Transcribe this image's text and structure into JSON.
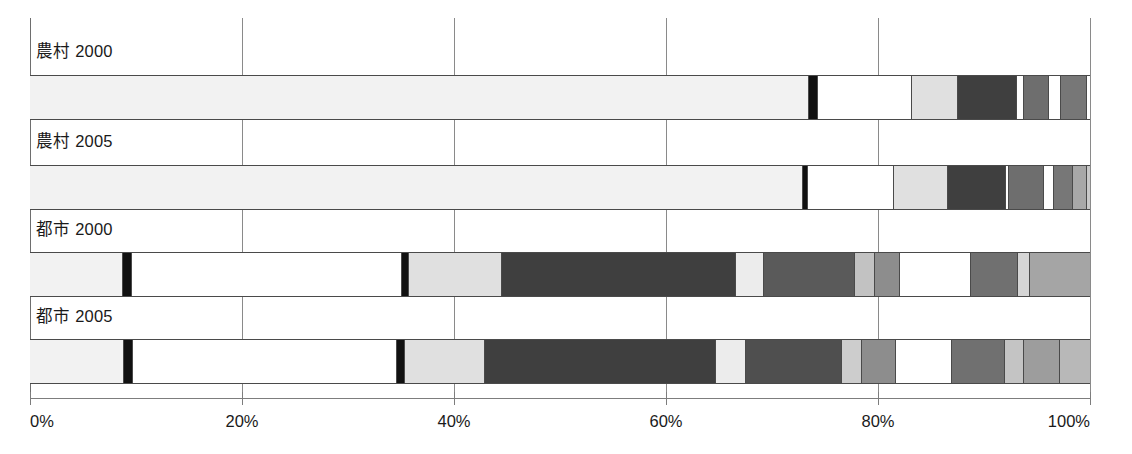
{
  "chart_data": {
    "type": "bar",
    "orientation": "horizontal",
    "stacked": true,
    "normalized": true,
    "title": "",
    "xlabel": "",
    "ylabel": "",
    "xlim": [
      0,
      100
    ],
    "xticks": [
      0,
      20,
      40,
      60,
      80,
      100
    ],
    "xtick_labels": [
      "0%",
      "20%",
      "40%",
      "60%",
      "80%",
      "100%"
    ],
    "grid": true,
    "legend": "none",
    "categories": [
      "農村 2000",
      "農村 2005",
      "都市 2000",
      "都市 2005"
    ],
    "series": [
      {
        "name": "農村 2000",
        "segments": [
          {
            "value": 73.4,
            "color": "#f2f2f2"
          },
          {
            "value": 0.8,
            "color": "#111111"
          },
          {
            "value": 8.9,
            "color": "#ffffff"
          },
          {
            "value": 4.4,
            "color": "#e0e0e0"
          },
          {
            "value": 5.5,
            "color": "#3f3f3f"
          },
          {
            "value": 0.7,
            "color": "#ffffff"
          },
          {
            "value": 2.3,
            "color": "#6e6e6e"
          },
          {
            "value": 1.2,
            "color": "#ffffff"
          },
          {
            "value": 2.4,
            "color": "#777777"
          },
          {
            "value": 0.4,
            "color": "#ffffff"
          },
          {
            "value": 0.0,
            "color": "#9a9a9a"
          }
        ]
      },
      {
        "name": "農村 2005",
        "segments": [
          {
            "value": 72.8,
            "color": "#f2f2f2"
          },
          {
            "value": 0.5,
            "color": "#111111"
          },
          {
            "value": 8.1,
            "color": "#ffffff"
          },
          {
            "value": 5.1,
            "color": "#e0e0e0"
          },
          {
            "value": 5.5,
            "color": "#3f3f3f"
          },
          {
            "value": 0.3,
            "color": "#ffffff"
          },
          {
            "value": 3.3,
            "color": "#6e6e6e"
          },
          {
            "value": 0.9,
            "color": "#ffffff"
          },
          {
            "value": 1.8,
            "color": "#777777"
          },
          {
            "value": 1.3,
            "color": "#a8a8a8"
          },
          {
            "value": 0.4,
            "color": "#c9c9c9"
          }
        ]
      },
      {
        "name": "都市 2000",
        "segments": [
          {
            "value": 8.7,
            "color": "#f2f2f2"
          },
          {
            "value": 0.8,
            "color": "#111111"
          },
          {
            "value": 25.5,
            "color": "#ffffff"
          },
          {
            "value": 0.7,
            "color": "#111111"
          },
          {
            "value": 8.7,
            "color": "#e0e0e0"
          },
          {
            "value": 22.1,
            "color": "#3f3f3f"
          },
          {
            "value": 2.7,
            "color": "#ececec"
          },
          {
            "value": 8.5,
            "color": "#5a5a5a"
          },
          {
            "value": 1.9,
            "color": "#c2c2c2"
          },
          {
            "value": 2.4,
            "color": "#8d8d8d"
          },
          {
            "value": 6.7,
            "color": "#ffffff"
          },
          {
            "value": 4.4,
            "color": "#707070"
          },
          {
            "value": 1.2,
            "color": "#d5d5d5"
          },
          {
            "value": 5.7,
            "color": "#a5a5a5"
          }
        ]
      },
      {
        "name": "都市 2005",
        "segments": [
          {
            "value": 8.8,
            "color": "#f2f2f2"
          },
          {
            "value": 0.8,
            "color": "#111111"
          },
          {
            "value": 24.9,
            "color": "#ffffff"
          },
          {
            "value": 0.8,
            "color": "#111111"
          },
          {
            "value": 7.5,
            "color": "#e0e0e0"
          },
          {
            "value": 21.8,
            "color": "#3f3f3f"
          },
          {
            "value": 2.9,
            "color": "#ececec"
          },
          {
            "value": 9.0,
            "color": "#4f4f4f"
          },
          {
            "value": 1.9,
            "color": "#cdcdcd"
          },
          {
            "value": 3.2,
            "color": "#8d8d8d"
          },
          {
            "value": 5.3,
            "color": "#ffffff"
          },
          {
            "value": 5.0,
            "color": "#707070"
          },
          {
            "value": 1.8,
            "color": "#c4c4c4"
          },
          {
            "value": 3.4,
            "color": "#9d9d9d"
          },
          {
            "value": 3.0,
            "color": "#b8b8b8"
          }
        ]
      }
    ]
  },
  "axis": {
    "ticks": [
      {
        "label": "0%",
        "pos": 0
      },
      {
        "label": "20%",
        "pos": 20
      },
      {
        "label": "40%",
        "pos": 40
      },
      {
        "label": "60%",
        "pos": 60
      },
      {
        "label": "80%",
        "pos": 80
      },
      {
        "label": "100%",
        "pos": 100
      }
    ]
  },
  "rows": [
    {
      "label": "農村 2000",
      "label_top": 20,
      "bar_top": 57
    },
    {
      "label": "農村 2005",
      "label_top": 110,
      "bar_top": 147
    },
    {
      "label": "都市 2000",
      "label_top": 198,
      "bar_top": 234
    },
    {
      "label": "都市 2005",
      "label_top": 285,
      "bar_top": 321
    }
  ],
  "geometry": {
    "plot_left": 30,
    "plot_right": 1090,
    "plot_width": 1060,
    "bar_height": 43
  }
}
